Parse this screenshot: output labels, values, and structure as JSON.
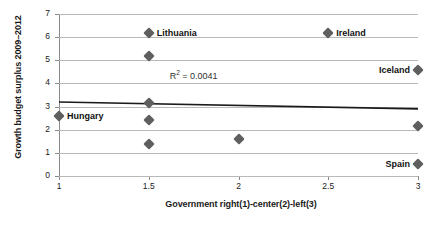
{
  "chart_data": {
    "type": "scatter",
    "title": "",
    "xlabel": "Government right(1)-center(2)-left(3)",
    "ylabel": "Growth budget surplus 2009–2012",
    "xlim": [
      1,
      3
    ],
    "ylim": [
      0,
      7
    ],
    "xticks": [
      "1",
      "1.5",
      "2",
      "2.5",
      "3"
    ],
    "xtick_values": [
      1,
      1.5,
      2,
      2.5,
      3
    ],
    "yticks": [
      "0",
      "1",
      "2",
      "3",
      "4",
      "5",
      "6",
      "7"
    ],
    "ytick_values": [
      0,
      1,
      2,
      3,
      4,
      5,
      6,
      7
    ],
    "grid": "horizontal",
    "legend": "none",
    "marker_color": "#5f5f5f",
    "gridline_color": "#b9b9b9",
    "axis_color": "#8a8a8a",
    "trendline_color": "#1a1a1a",
    "points": [
      {
        "x": 1,
        "y": 2.6,
        "label": "Hungary",
        "label_side": "right"
      },
      {
        "x": 1.5,
        "y": 6.2,
        "label": "Lithuania",
        "label_side": "right"
      },
      {
        "x": 1.5,
        "y": 5.2,
        "label": "",
        "label_side": "right"
      },
      {
        "x": 1.5,
        "y": 3.15,
        "label": "",
        "label_side": "right"
      },
      {
        "x": 1.5,
        "y": 2.4,
        "label": "",
        "label_side": "right"
      },
      {
        "x": 1.5,
        "y": 1.4,
        "label": "",
        "label_side": "right"
      },
      {
        "x": 2,
        "y": 1.6,
        "label": "",
        "label_side": "right"
      },
      {
        "x": 2.5,
        "y": 6.2,
        "label": "Ireland",
        "label_side": "right"
      },
      {
        "x": 3,
        "y": 4.6,
        "label": "Iceland",
        "label_side": "left"
      },
      {
        "x": 3,
        "y": 2.15,
        "label": "",
        "label_side": "right"
      },
      {
        "x": 3,
        "y": 0.5,
        "label": "Spain",
        "label_side": "left"
      }
    ],
    "trendline": {
      "x0": 1,
      "y0": 3.2,
      "x1": 3,
      "y1": 2.9
    },
    "annotations": [
      {
        "text": "R² = 0.0041",
        "prefix": "R",
        "sup": "2",
        "suffix": " = 0.0041",
        "x": 1.75,
        "y": 4.35
      }
    ]
  }
}
